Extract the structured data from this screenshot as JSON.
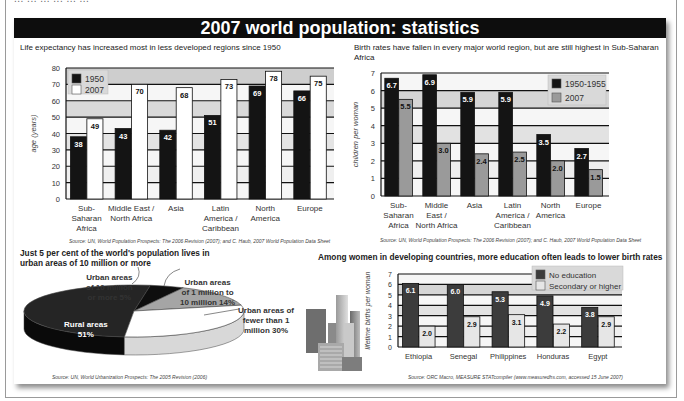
{
  "header": {
    "clipped_text": "... ... ... ... ... ...",
    "title": "2007 world population: statistics"
  },
  "colors": {
    "title_bg": "#0d0d0d",
    "dark_bar": "#141414",
    "white_bar": "#ffffff",
    "gray_bar": "#9a9a9a",
    "slate_bar": "#3c3c3c",
    "light_bar": "#e6e6e6",
    "band_dark": "#cfcfcf",
    "band_light": "#f3f3f3"
  },
  "panels": {
    "life": {
      "title": "Life expectancy has increased most in less developed regions since 1950",
      "source": "Source: UN, World Population Prospects: The 2006 Revision (2007); and C. Haub, 2007 World Population Data Sheet"
    },
    "birth": {
      "title": "Birth rates have fallen in every major world region, but are still highest in Sub-Saharan Africa",
      "source": "Source: UN, World Population Prospects: The 2006 Revision (2007); and C. Haub, 2007 World Population Data Sheet"
    },
    "urban": {
      "title_line1": "Just 5 per cent of the world's population lives in",
      "title_line2": "urban areas of 10 million or more",
      "source": "Source: UN, World Urbanization Prospects: The 2005 Revision (2006)"
    },
    "education": {
      "title": "Among women in developing countries, more education often leads to lower birth rates",
      "source": "Source: ORC Macro, MEASURE STATcompiler (www.measuredhs.com, accessed 15 June 2007)"
    }
  },
  "chart_data": [
    {
      "type": "bar",
      "title": "Life expectancy has increased most in less developed regions since 1950",
      "xlabel": "",
      "ylabel": "age (years)",
      "ylim": [
        0,
        80
      ],
      "yticks": [
        0,
        10,
        20,
        30,
        40,
        50,
        60,
        70,
        80
      ],
      "grid": true,
      "legend_position": "top-left",
      "categories": [
        "Sub-Saharan Africa",
        "Middle East / North Africa",
        "Asia",
        "Latin America / Caribbean",
        "North America",
        "Europe"
      ],
      "category_lines": [
        [
          "Sub-",
          "Saharan",
          "Africa"
        ],
        [
          "Middle East /",
          "North Africa"
        ],
        [
          "Asia"
        ],
        [
          "Latin",
          "America /",
          "Caribbean"
        ],
        [
          "North",
          "America"
        ],
        [
          "Europe"
        ]
      ],
      "series": [
        {
          "name": "1950",
          "values": [
            38,
            43,
            42,
            51,
            69,
            66
          ]
        },
        {
          "name": "2007",
          "values": [
            49,
            70,
            68,
            73,
            78,
            75
          ]
        }
      ]
    },
    {
      "type": "bar",
      "title": "Birth rates have fallen in every major world region, but are still highest in Sub-Saharan Africa",
      "xlabel": "",
      "ylabel": "children per woman",
      "ylim": [
        0,
        7
      ],
      "yticks": [
        0,
        1,
        2,
        3,
        4,
        5,
        6,
        7
      ],
      "grid": true,
      "legend_position": "top-right",
      "categories": [
        "Sub-Saharan Africa",
        "Middle East / North Africa",
        "Asia",
        "Latin America / Caribbean",
        "North America",
        "Europe"
      ],
      "category_lines": [
        [
          "Sub-",
          "Saharan",
          "Africa"
        ],
        [
          "Middle",
          "East /",
          "North Africa"
        ],
        [
          "Asia"
        ],
        [
          "Latin",
          "America /",
          "Caribbean"
        ],
        [
          "North",
          "America"
        ],
        [
          "Europe"
        ]
      ],
      "series": [
        {
          "name": "1950-1955",
          "values": [
            6.7,
            6.9,
            5.9,
            5.9,
            3.5,
            2.7
          ],
          "labels": [
            "6.7",
            "6.9",
            "5.9",
            "5.9",
            "3.5",
            "2.7"
          ]
        },
        {
          "name": "2007",
          "values": [
            5.5,
            3.0,
            2.4,
            2.5,
            2.0,
            1.5
          ],
          "labels": [
            "5.5",
            "3.0",
            "2.4",
            "2.5",
            "2.0",
            "1.5"
          ]
        }
      ]
    },
    {
      "type": "pie",
      "title": "Just 5 per cent of the world's population lives in urban areas of 10 million or more",
      "slices": [
        {
          "label": "Rural areas",
          "value": 51,
          "display": "51%",
          "color": "#252525"
        },
        {
          "label": "Urban areas of 10 million or more",
          "value": 5,
          "display": "5%",
          "color": "#0e0e0e"
        },
        {
          "label": "Urban areas of 1 million to 10 million",
          "value": 14,
          "display": "14%",
          "color": "#a5a5a5"
        },
        {
          "label": "Urban areas of fewer than 1 million",
          "value": 30,
          "display": "30%",
          "color": "#ffffff"
        }
      ],
      "labels": {
        "rural": [
          "Rural areas",
          "51%"
        ],
        "big": [
          "Urban areas",
          "of 10 million",
          "or more 5%"
        ],
        "mid": [
          "Urban areas",
          "of 1 million to",
          "10 million 14%"
        ],
        "small": [
          "Urban areas of",
          "fewer than 1",
          "million 30%"
        ]
      }
    },
    {
      "type": "bar",
      "title": "Among women in developing countries, more education often leads to lower birth rates",
      "xlabel": "",
      "ylabel": "lifetime births per woman",
      "ylim": [
        0,
        7
      ],
      "yticks": [
        0,
        1,
        2,
        3,
        4,
        5,
        6,
        7
      ],
      "grid": true,
      "legend_position": "top-right",
      "categories": [
        "Ethiopia",
        "Senegal",
        "Philippines",
        "Honduras",
        "Egypt"
      ],
      "series": [
        {
          "name": "No education",
          "values": [
            6.1,
            6.0,
            5.3,
            4.9,
            3.8
          ],
          "labels": [
            "6.1",
            "6.0",
            "5.3",
            "4.9",
            "3.8"
          ]
        },
        {
          "name": "Secondary or higher",
          "values": [
            2.0,
            2.9,
            3.1,
            2.2,
            2.9
          ],
          "labels": [
            "2.0",
            "2.9",
            "3.1",
            "2.2",
            "2.9"
          ]
        }
      ]
    }
  ]
}
